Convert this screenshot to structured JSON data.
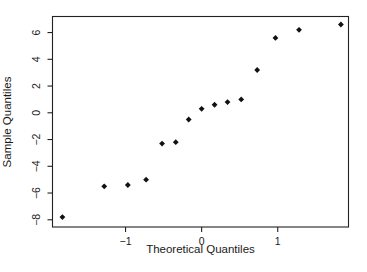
{
  "figure": {
    "background": "#ffffff",
    "foreground": "#1a1a1a",
    "box_stroke": "#222222",
    "point_color": "#111111"
  },
  "chart_data": {
    "type": "scatter",
    "title": "",
    "xlabel": "Theoretical Quantiles",
    "ylabel": "Sample Quantiles",
    "marker": "filled-diamond",
    "grid": false,
    "legend": null,
    "x": [
      -1.83,
      -1.28,
      -0.97,
      -0.73,
      -0.52,
      -0.34,
      -0.17,
      0,
      0.17,
      0.34,
      0.52,
      0.73,
      0.97,
      1.28,
      1.83
    ],
    "y": [
      -7.8,
      -5.5,
      -5.4,
      -5.0,
      -2.3,
      -2.2,
      -0.5,
      0.3,
      0.6,
      0.8,
      1.0,
      3.2,
      5.6,
      6.2,
      6.6
    ],
    "x_ticks": [
      -1,
      0,
      1
    ],
    "y_ticks": [
      -8,
      -6,
      -4,
      -2,
      0,
      2,
      4,
      6
    ],
    "xlim": [
      -1.96,
      1.93
    ],
    "ylim": [
      -8.54,
      7.2
    ]
  }
}
